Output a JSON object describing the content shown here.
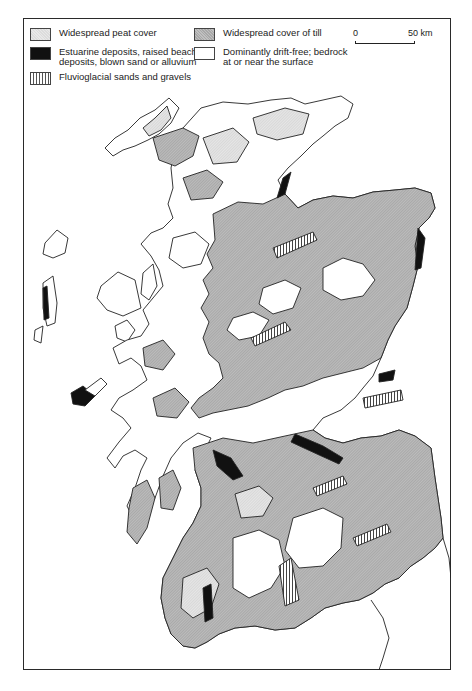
{
  "legend": {
    "items": [
      {
        "key": "peat",
        "label": "Widespread peat cover",
        "color": "#e0e0e0"
      },
      {
        "key": "estuarine",
        "label_line1": "Estuarine deposits, raised beach",
        "label_line2": "deposits, blown sand or alluvium",
        "color": "#111111"
      },
      {
        "key": "fluvioglacial",
        "label": "Fluvioglacial sands and gravels",
        "pattern": "vertical-hatch"
      },
      {
        "key": "till",
        "label": "Widespread cover of till",
        "color": "#b4b4b4"
      },
      {
        "key": "drift_free",
        "label_line1": "Dominantly drift-free; bedrock",
        "label_line2": "at or near the surface",
        "color": "#ffffff"
      }
    ]
  },
  "scale_bar": {
    "start_label": "0",
    "end_label": "50 km"
  },
  "map": {
    "subject": "Scotland superficial deposits",
    "colors": {
      "peat": "#e2e2e2",
      "till": "#b4b4b4",
      "estuarine": "#111111",
      "drift_free": "#ffffff",
      "outline": "#222222"
    }
  }
}
